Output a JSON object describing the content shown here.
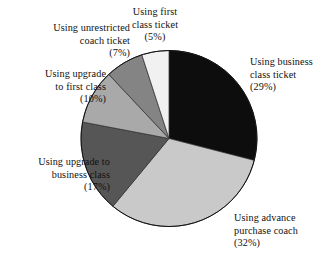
{
  "chart_data": {
    "type": "pie",
    "title": "",
    "subtitle": "",
    "xlabel": "",
    "ylabel": "",
    "legend_position": "none",
    "grid": false,
    "units": "percent",
    "start_angle_deg": 0,
    "direction": "clockwise",
    "total": 100,
    "categories": [
      "Using business class ticket",
      "Using advance purchase coach",
      "Using upgrade to business class",
      "Using upgrade to first class",
      "Using unrestricted coach ticket",
      "Using first class ticket"
    ],
    "values": [
      29,
      32,
      17,
      10,
      7,
      5
    ],
    "colors": [
      "#0d0d0d",
      "#c9c9c9",
      "#565656",
      "#a9a9a9",
      "#848484",
      "#f1f1f1"
    ],
    "slices": [
      {
        "id": "business-class-ticket",
        "name": "Using business class ticket",
        "value": 29,
        "percent_label": "(29%)",
        "color": "#0d0d0d",
        "start_deg": 0,
        "end_deg": 104.4
      },
      {
        "id": "advance-purchase-coach",
        "name": "Using advance purchase coach",
        "value": 32,
        "percent_label": "(32%)",
        "color": "#c9c9c9",
        "start_deg": 104.4,
        "end_deg": 219.6
      },
      {
        "id": "upgrade-to-business-class",
        "name": "Using upgrade to business class",
        "value": 17,
        "percent_label": "(17%)",
        "color": "#565656",
        "start_deg": 219.6,
        "end_deg": 280.8
      },
      {
        "id": "upgrade-to-first-class",
        "name": "Using upgrade to first class",
        "value": 10,
        "percent_label": "(10%)",
        "color": "#a9a9a9",
        "start_deg": 280.8,
        "end_deg": 316.8
      },
      {
        "id": "unrestricted-coach-ticket",
        "name": "Using unrestricted coach ticket",
        "value": 7,
        "percent_label": "(7%)",
        "color": "#848484",
        "start_deg": 316.8,
        "end_deg": 342.0
      },
      {
        "id": "first-class-ticket",
        "name": "Using first class ticket",
        "value": 5,
        "percent_label": "(5%)",
        "color": "#f1f1f1",
        "start_deg": 342.0,
        "end_deg": 360.0
      }
    ]
  },
  "labels": {
    "first_class": {
      "line1": "Using first",
      "line2": "class ticket",
      "line3": "(5%)"
    },
    "unrestricted_coach": {
      "line1": "Using unrestricted",
      "line2": "coach ticket",
      "line3": "(7%)"
    },
    "upgrade_first": {
      "line1": "Using upgrade",
      "line2": "to first class",
      "line3": "(10%)"
    },
    "upgrade_business": {
      "line1": "Using upgrade to",
      "line2": "business class",
      "line3": "(17%)"
    },
    "business_class": {
      "line1": "Using business",
      "line2": "class ticket",
      "line3": "(29%)"
    },
    "advance_purchase": {
      "line1": "Using advance",
      "line2": "purchase coach",
      "line3": "(32%)"
    }
  },
  "geometry": {
    "center_x": 169,
    "center_y": 138.5,
    "radius": 88,
    "canvas_width": 327,
    "canvas_height": 265
  },
  "theme": {
    "background": "#ffffff",
    "text_color": "#111111",
    "outline_color": "#111111"
  }
}
